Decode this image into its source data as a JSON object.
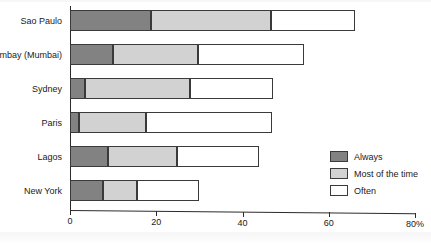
{
  "chart_data": {
    "type": "bar",
    "orientation": "horizontal",
    "stacked": true,
    "title": "",
    "xlabel": "",
    "ylabel": "",
    "xlim": [
      0,
      80
    ],
    "xticks": [
      0,
      20,
      40,
      60,
      80
    ],
    "xtick_labels": [
      "0",
      "20",
      "40",
      "60",
      "80%"
    ],
    "grid": false,
    "legend_position": "bottom-right",
    "categories": [
      "Sao Paulo",
      "Bombay (Mumbai)",
      "Sydney",
      "Paris",
      "Lagos",
      "New York"
    ],
    "series": [
      {
        "name": "Always",
        "color": "#828282",
        "values": [
          18.7,
          10.0,
          3.5,
          2.0,
          8.8,
          7.6
        ]
      },
      {
        "name": "Most of the time",
        "color": "#d2d2d2",
        "values": [
          28.0,
          19.6,
          24.3,
          15.7,
          16.0,
          7.9
        ]
      },
      {
        "name": "Often",
        "color": "#ffffff",
        "values": [
          19.4,
          24.7,
          19.2,
          29.1,
          19.0,
          14.4
        ]
      }
    ],
    "totals": [
      66.1,
      54.3,
      47.0,
      46.8,
      43.8,
      29.9
    ]
  },
  "legend": {
    "items": [
      {
        "label": "Always",
        "swatch": "always"
      },
      {
        "label": "Most of the time",
        "swatch": "most"
      },
      {
        "label": "Often",
        "swatch": "often"
      }
    ]
  }
}
